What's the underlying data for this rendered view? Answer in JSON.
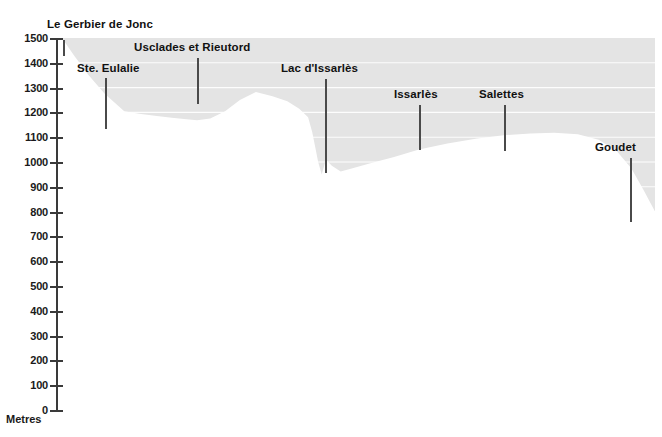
{
  "chart_data": {
    "type": "area",
    "title": "",
    "xlabel": "",
    "ylabel": "Metres",
    "ylim": [
      0,
      1500
    ],
    "grid": true,
    "legend": "none",
    "y_ticks": [
      1500,
      1400,
      1300,
      1200,
      1100,
      1000,
      900,
      800,
      700,
      600,
      500,
      400,
      300,
      200,
      100,
      0
    ],
    "series": [
      {
        "name": "Land surface elevation",
        "x_fraction": [
          0.0,
          0.02,
          0.045,
          0.072,
          0.105,
          0.13,
          0.16,
          0.185,
          0.21,
          0.228,
          0.25,
          0.275,
          0.3,
          0.327,
          0.355,
          0.38,
          0.4,
          0.415,
          0.422,
          0.427,
          0.432,
          0.438,
          0.445,
          0.455,
          0.47,
          0.49,
          0.52,
          0.56,
          0.602,
          0.65,
          0.7,
          0.745,
          0.79,
          0.83,
          0.87,
          0.905,
          0.935,
          0.96,
          0.98,
          1.0
        ],
        "values": [
          1500,
          1430,
          1350,
          1275,
          1205,
          1195,
          1185,
          1178,
          1172,
          1168,
          1175,
          1205,
          1250,
          1282,
          1265,
          1245,
          1215,
          1180,
          1120,
          1060,
          1000,
          950,
          1010,
          985,
          962,
          975,
          995,
          1020,
          1050,
          1075,
          1095,
          1108,
          1115,
          1118,
          1112,
          1090,
          1045,
          975,
          890,
          800
        ]
      }
    ],
    "geology_bands": [
      {
        "name": "band-upper-light",
        "from": 580,
        "to": 395,
        "color": "#ebebeb"
      },
      {
        "name": "band-mid-grey",
        "from": 395,
        "to": 290,
        "color": "#c2c2c2"
      },
      {
        "name": "band-mid-light",
        "from": 290,
        "to": 195,
        "color": "#d2d2d2"
      },
      {
        "name": "band-lower-dark",
        "from": 195,
        "to": 0,
        "color": "#a8a8a8"
      }
    ],
    "sky_fill_color": "#e4e4e4",
    "terrain_fill_color": "#ffffff",
    "gridline_color": "#ffffff",
    "axis_color": "#3a3a3a"
  },
  "axis": {
    "unit_label": "Metres",
    "ticks": [
      "1500",
      "1400",
      "1300",
      "1200",
      "1100",
      "1000",
      "900",
      "800",
      "700",
      "600",
      "500",
      "400",
      "300",
      "200",
      "100",
      "0"
    ]
  },
  "markers": [
    {
      "id": "le-gerbier-de-jonc",
      "label": "Le Gerbier de Jonc",
      "label_x": 47,
      "label_y": 18,
      "rule_x": 63,
      "rule_top": 40,
      "rule_bottom": 56
    },
    {
      "id": "ste-eulalie",
      "label": "Ste. Eulalie",
      "label_x": 77,
      "label_y": 62,
      "rule_x": 105,
      "rule_top": 78,
      "rule_bottom": 129
    },
    {
      "id": "usclades-et-rieutord",
      "label": "Usclades et Rieutord",
      "label_x": 134,
      "label_y": 41,
      "rule_x": 197,
      "rule_top": 58,
      "rule_bottom": 104
    },
    {
      "id": "lac-dissarles",
      "label": "Lac d'Issarlès",
      "label_x": 281,
      "label_y": 62,
      "rule_x": 325,
      "rule_top": 79,
      "rule_bottom": 173
    },
    {
      "id": "issarles",
      "label": "Issarlès",
      "label_x": 394,
      "label_y": 88,
      "rule_x": 419,
      "rule_top": 105,
      "rule_bottom": 150
    },
    {
      "id": "salettes",
      "label": "Salettes",
      "label_x": 479,
      "label_y": 88,
      "rule_x": 504,
      "rule_top": 105,
      "rule_bottom": 151
    },
    {
      "id": "goudet",
      "label": "Goudet",
      "label_x": 595,
      "label_y": 141,
      "rule_x": 630,
      "rule_top": 158,
      "rule_bottom": 222
    }
  ]
}
